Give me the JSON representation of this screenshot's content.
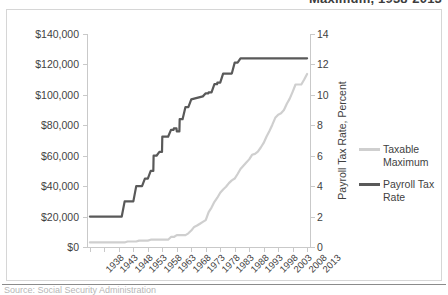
{
  "figure": {
    "title_partial": "Maximum, 1938-2013",
    "source_partial": "Source: Social Security Administration"
  },
  "chart_data": {
    "type": "line",
    "title": "Maximum, 1938-2013",
    "xlabel": "",
    "ylabel": "",
    "grid": false,
    "legend_position": "right",
    "x": [
      1938,
      1943,
      1948,
      1953,
      1958,
      1963,
      1968,
      1973,
      1978,
      1983,
      1988,
      1993,
      1998,
      2003,
      2008,
      2013
    ],
    "xtick_labels": [
      "1938",
      "1943",
      "1948",
      "1953",
      "1958",
      "1963",
      "1968",
      "1973",
      "1978",
      "1983",
      "1988",
      "1993",
      "1998",
      "2003",
      "2008",
      "2013"
    ],
    "xlim": [
      1937,
      2014
    ],
    "axes": [
      {
        "side": "left",
        "label": "",
        "ylim": [
          0,
          140000
        ],
        "ytick_labels": [
          "$0",
          "$20,000",
          "$40,000",
          "$60,000",
          "$80,000",
          "$100,000",
          "$120,000",
          "$140,000"
        ],
        "ytick_values": [
          0,
          20000,
          40000,
          60000,
          80000,
          100000,
          120000,
          140000
        ]
      },
      {
        "side": "right",
        "label": "Payroll Tax Rate, Percent",
        "ylim": [
          0,
          14
        ],
        "ytick_labels": [
          "0",
          "2",
          "4",
          "6",
          "8",
          "10",
          "12",
          "14"
        ],
        "ytick_values": [
          0,
          2,
          4,
          6,
          8,
          10,
          12,
          14
        ]
      }
    ],
    "series": [
      {
        "name": "Taxable Maximum",
        "axis": "left",
        "color": "#cfcfcf",
        "unit": "dollars",
        "points": [
          [
            1938,
            3000
          ],
          [
            1940,
            3000
          ],
          [
            1945,
            3000
          ],
          [
            1950,
            3000
          ],
          [
            1951,
            3600
          ],
          [
            1954,
            3600
          ],
          [
            1955,
            4200
          ],
          [
            1958,
            4200
          ],
          [
            1959,
            4800
          ],
          [
            1965,
            4800
          ],
          [
            1966,
            6600
          ],
          [
            1967,
            6600
          ],
          [
            1968,
            7800
          ],
          [
            1971,
            7800
          ],
          [
            1972,
            9000
          ],
          [
            1973,
            10800
          ],
          [
            1974,
            13200
          ],
          [
            1975,
            14100
          ],
          [
            1976,
            15300
          ],
          [
            1977,
            16500
          ],
          [
            1978,
            17700
          ],
          [
            1979,
            22900
          ],
          [
            1980,
            25900
          ],
          [
            1981,
            29700
          ],
          [
            1982,
            32400
          ],
          [
            1983,
            35700
          ],
          [
            1984,
            37800
          ],
          [
            1985,
            39600
          ],
          [
            1986,
            42000
          ],
          [
            1987,
            43800
          ],
          [
            1988,
            45000
          ],
          [
            1989,
            48000
          ],
          [
            1990,
            51300
          ],
          [
            1991,
            53400
          ],
          [
            1992,
            55500
          ],
          [
            1993,
            57600
          ],
          [
            1994,
            60600
          ],
          [
            1995,
            61200
          ],
          [
            1996,
            62700
          ],
          [
            1997,
            65400
          ],
          [
            1998,
            68400
          ],
          [
            1999,
            72600
          ],
          [
            2000,
            76200
          ],
          [
            2001,
            80400
          ],
          [
            2002,
            84900
          ],
          [
            2003,
            87000
          ],
          [
            2004,
            87900
          ],
          [
            2005,
            90000
          ],
          [
            2006,
            94200
          ],
          [
            2007,
            97500
          ],
          [
            2008,
            102000
          ],
          [
            2009,
            106800
          ],
          [
            2010,
            106800
          ],
          [
            2011,
            106800
          ],
          [
            2012,
            110100
          ],
          [
            2013,
            113700
          ]
        ]
      },
      {
        "name": "Payroll Tax Rate",
        "axis": "right",
        "color": "#595959",
        "unit": "percent",
        "points": [
          [
            1938,
            2.0
          ],
          [
            1949,
            2.0
          ],
          [
            1950,
            3.0
          ],
          [
            1953,
            3.0
          ],
          [
            1954,
            4.0
          ],
          [
            1956,
            4.0
          ],
          [
            1957,
            4.5
          ],
          [
            1958,
            4.5
          ],
          [
            1959,
            5.0
          ],
          [
            1959.9,
            5.0
          ],
          [
            1960,
            6.0
          ],
          [
            1961,
            6.0
          ],
          [
            1962,
            6.25
          ],
          [
            1962.9,
            6.25
          ],
          [
            1963,
            7.25
          ],
          [
            1965,
            7.25
          ],
          [
            1966,
            7.7
          ],
          [
            1966.9,
            7.7
          ],
          [
            1967,
            7.8
          ],
          [
            1967.9,
            7.8
          ],
          [
            1968,
            7.6
          ],
          [
            1968.9,
            7.6
          ],
          [
            1969,
            8.4
          ],
          [
            1970,
            8.4
          ],
          [
            1971,
            9.2
          ],
          [
            1972,
            9.2
          ],
          [
            1973,
            9.7
          ],
          [
            1977,
            9.9
          ],
          [
            1978,
            10.1
          ],
          [
            1978.9,
            10.1
          ],
          [
            1979,
            10.16
          ],
          [
            1980,
            10.16
          ],
          [
            1981,
            10.7
          ],
          [
            1981.9,
            10.7
          ],
          [
            1982,
            10.8
          ],
          [
            1983,
            10.8
          ],
          [
            1984,
            11.4
          ],
          [
            1987,
            11.4
          ],
          [
            1988,
            12.12
          ],
          [
            1989,
            12.12
          ],
          [
            1990,
            12.4
          ],
          [
            2013,
            12.4
          ]
        ]
      }
    ]
  },
  "legend": {
    "items": [
      {
        "label": "Taxable Maximum",
        "color": "#cfcfcf"
      },
      {
        "label": "Payroll Tax Rate",
        "color": "#595959"
      }
    ]
  }
}
